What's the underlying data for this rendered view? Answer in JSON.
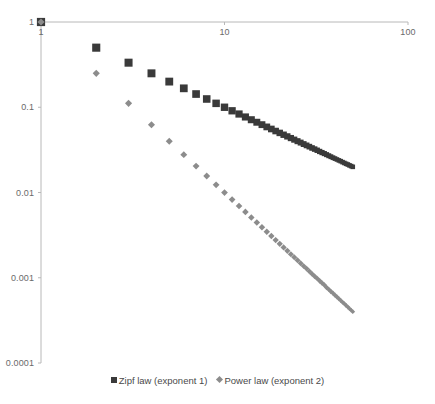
{
  "chart_data": {
    "type": "scatter",
    "title": "",
    "subtitle": "",
    "xlabel": "",
    "ylabel": "",
    "xscale": "log",
    "yscale": "log",
    "xlim": [
      1,
      100
    ],
    "ylim": [
      0.0001,
      1
    ],
    "grid": false,
    "x_axis_position": "top",
    "legend_position": "bottom",
    "xticks": [
      "1",
      "10",
      "100"
    ],
    "xtick_values": [
      1,
      10,
      100
    ],
    "yticks": [
      "1",
      "0.1",
      "0.01",
      "0.001",
      "0.0001"
    ],
    "ytick_values": [
      1,
      0.1,
      0.01,
      0.001,
      0.0001
    ],
    "x": [
      1,
      2,
      3,
      4,
      5,
      6,
      7,
      8,
      9,
      10,
      11,
      12,
      13,
      14,
      15,
      16,
      17,
      18,
      19,
      20,
      21,
      22,
      23,
      24,
      25,
      26,
      27,
      28,
      29,
      30,
      31,
      32,
      33,
      34,
      35,
      36,
      37,
      38,
      39,
      40,
      41,
      42,
      43,
      44,
      45,
      46,
      47,
      48,
      49,
      50
    ],
    "series": [
      {
        "name": "Zipf law (exponent 1)",
        "marker": "square",
        "color": "#3a3a3a",
        "exponent": 1,
        "values": [
          1,
          0.5,
          0.3333,
          0.25,
          0.2,
          0.1667,
          0.1429,
          0.125,
          0.1111,
          0.1,
          0.0909,
          0.0833,
          0.0769,
          0.0714,
          0.0667,
          0.0625,
          0.0588,
          0.0556,
          0.0526,
          0.05,
          0.0476,
          0.0455,
          0.0435,
          0.0417,
          0.04,
          0.0385,
          0.037,
          0.0357,
          0.0345,
          0.0333,
          0.0323,
          0.0313,
          0.0303,
          0.0294,
          0.0286,
          0.0278,
          0.027,
          0.0263,
          0.0256,
          0.025,
          0.0244,
          0.0238,
          0.0233,
          0.0227,
          0.0222,
          0.0217,
          0.0213,
          0.0208,
          0.0204,
          0.02
        ]
      },
      {
        "name": "Power law (exponent 2)",
        "marker": "diamond",
        "color": "#8c8c8c",
        "exponent": 2,
        "values": [
          1,
          0.25,
          0.1111,
          0.0625,
          0.04,
          0.0278,
          0.0204,
          0.0156,
          0.0123,
          0.01,
          0.00826,
          0.00694,
          0.00592,
          0.0051,
          0.00444,
          0.00391,
          0.00346,
          0.00309,
          0.00277,
          0.0025,
          0.00227,
          0.00207,
          0.00189,
          0.00174,
          0.0016,
          0.00148,
          0.00137,
          0.00128,
          0.00119,
          0.00111,
          0.00104,
          0.00098,
          0.00092,
          0.00087,
          0.00082,
          0.00077,
          0.00073,
          0.00069,
          0.00066,
          0.000625,
          0.000595,
          0.000567,
          0.000541,
          0.000517,
          0.000494,
          0.000473,
          0.000453,
          0.000434,
          0.000416,
          0.0004
        ]
      }
    ]
  },
  "legend": {
    "entries": [
      {
        "label": "Zipf law (exponent 1)"
      },
      {
        "label": "Power law (exponent 2)"
      }
    ]
  },
  "colors": {
    "series1": "#3a3a3a",
    "series2": "#8c8c8c",
    "axis": "#b8b8b8",
    "tick_text": "#6a6a6a"
  }
}
